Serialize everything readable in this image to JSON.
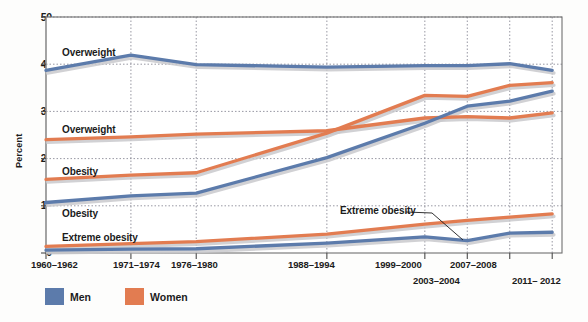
{
  "chart_data": {
    "type": "line",
    "title": "",
    "xlabel": "",
    "ylabel": "Percent",
    "ylim": [
      0,
      50
    ],
    "yticks": [
      0,
      10,
      20,
      30,
      40,
      50
    ],
    "grid": true,
    "legend_position": "bottom-left",
    "categories": [
      "1960–1962",
      "1971–1974",
      "1976–1980",
      "1988–1994",
      "1999–2000",
      "2003–2004",
      "2007–2008",
      "2011– 2012"
    ],
    "x_positions": [
      0,
      1.3,
      2.3,
      4.3,
      5.8,
      6.45,
      7.1,
      7.75
    ],
    "series": [
      {
        "name": "Men — Overweight",
        "group": "Men",
        "measure": "Overweight",
        "color": "#5c7bab",
        "values": [
          38.7,
          41.9,
          39.9,
          39.4,
          39.7,
          39.7,
          40.1,
          38.7
        ]
      },
      {
        "name": "Women — Overweight",
        "group": "Women",
        "measure": "Overweight",
        "color": "#e27c51",
        "values": [
          24.0,
          24.6,
          25.2,
          25.9,
          28.6,
          28.9,
          28.6,
          29.7
        ]
      },
      {
        "name": "Women — Obesity",
        "group": "Women",
        "measure": "Obesity",
        "color": "#e27c51",
        "values": [
          15.6,
          16.5,
          17.0,
          25.4,
          33.4,
          33.2,
          35.5,
          36.1
        ]
      },
      {
        "name": "Men — Obesity",
        "group": "Men",
        "measure": "Obesity",
        "color": "#5c7bab",
        "values": [
          10.7,
          12.1,
          12.7,
          20.2,
          27.5,
          31.1,
          32.2,
          34.3
        ]
      },
      {
        "name": "Women — Extreme obesity",
        "group": "Women",
        "measure": "Extreme obesity",
        "color": "#e27c51",
        "values": [
          1.4,
          2.0,
          2.4,
          4.0,
          6.1,
          6.9,
          7.6,
          8.3
        ]
      },
      {
        "name": "Men — Extreme obesity",
        "group": "Men",
        "measure": "Extreme obesity",
        "color": "#5c7bab",
        "values": [
          0.6,
          0.8,
          0.9,
          2.1,
          3.4,
          2.6,
          4.2,
          4.4
        ]
      }
    ],
    "annotations": [
      {
        "text": "Overweight",
        "x": 62,
        "y": 55,
        "series": "Men — Overweight"
      },
      {
        "text": "Overweight",
        "x": 62,
        "y": 132,
        "series": "Women — Overweight"
      },
      {
        "text": "Obesity",
        "x": 62,
        "y": 174,
        "series": "Women — Obesity"
      },
      {
        "text": "Obesity",
        "x": 62,
        "y": 216,
        "series": "Men — Obesity"
      },
      {
        "text": "Extreme obesity",
        "x": 62,
        "y": 240,
        "series": "Extreme obesity"
      },
      {
        "text": "Extreme obesity",
        "x": 340,
        "y": 213,
        "series": "Men — Extreme obesity",
        "leader": true
      }
    ],
    "legend": [
      {
        "label": "Men",
        "color": "#5c7bab"
      },
      {
        "label": "Women",
        "color": "#e27c51"
      }
    ]
  },
  "axis": {
    "y_title": "Percent"
  }
}
